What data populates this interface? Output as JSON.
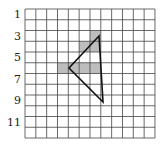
{
  "grid": {
    "rows": 12,
    "cols": 12,
    "origin_x": 25,
    "origin_y": 9,
    "cell_w": 10.83,
    "cell_h": 10.75,
    "line_color": "#444444",
    "shade_color": "#bdbdbd"
  },
  "row_labels": [
    {
      "row": 1,
      "text": "1"
    },
    {
      "row": 3,
      "text": "3"
    },
    {
      "row": 5,
      "text": "5"
    },
    {
      "row": 7,
      "text": "7"
    },
    {
      "row": 9,
      "text": "9"
    },
    {
      "row": 11,
      "text": "11"
    }
  ],
  "shaded_cells": [
    {
      "row": 3,
      "col": 7
    },
    {
      "row": 4,
      "col": 6
    },
    {
      "row": 4,
      "col": 7
    },
    {
      "row": 6,
      "col": 4
    },
    {
      "row": 6,
      "col": 5
    },
    {
      "row": 6,
      "col": 6
    },
    {
      "row": 6,
      "col": 7
    }
  ],
  "triangle": {
    "stroke": "#111111",
    "vertices": [
      {
        "x": 99,
        "y": 36
      },
      {
        "x": 69,
        "y": 68
      },
      {
        "x": 103,
        "y": 102
      }
    ]
  }
}
